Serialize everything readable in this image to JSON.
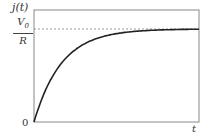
{
  "chart_data": {
    "type": "line",
    "title": "",
    "xlabel": "t",
    "ylabel": "j(t)",
    "y_ticks": [
      "0",
      "V0/R"
    ],
    "asymptote": {
      "label": "V0/R",
      "style": "dashed",
      "value": 1.0
    },
    "grid": false,
    "legend": null,
    "function": "j(t) = (V0/R)(1 - e^(-t/tau))",
    "series": [
      {
        "name": "j(t)",
        "x": [
          0,
          0.5,
          1,
          1.5,
          2,
          2.5,
          3,
          3.5,
          4,
          5,
          6
        ],
        "values": [
          0,
          0.39,
          0.63,
          0.78,
          0.86,
          0.92,
          0.95,
          0.97,
          0.98,
          0.99,
          1.0
        ]
      }
    ],
    "xlim": [
      0,
      6
    ],
    "ylim": [
      0,
      1.18
    ]
  },
  "labels": {
    "y_axis": "j(t)",
    "numerator": "V",
    "numerator_sub": "0",
    "denominator": "R",
    "origin": "0",
    "x_axis": "t"
  }
}
